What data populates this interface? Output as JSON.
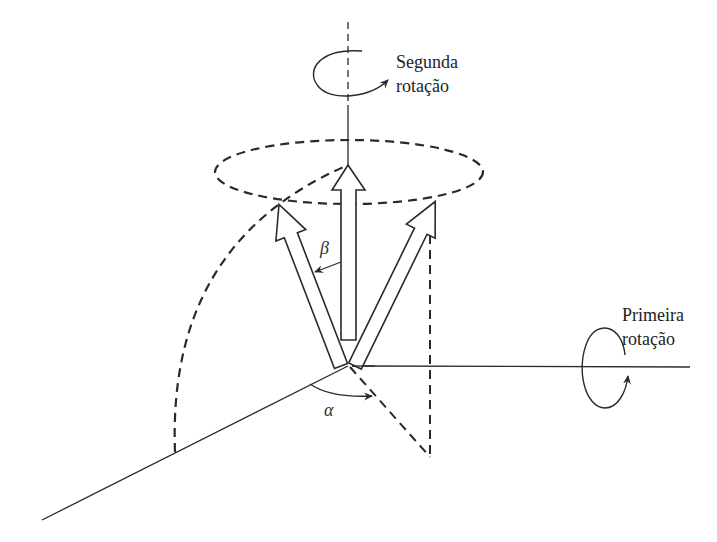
{
  "diagram": {
    "colors": {
      "stroke": "#2a2a2a",
      "background": "#ffffff"
    },
    "labels": {
      "second_rotation": {
        "line1": "Segunda",
        "line2": "rotação"
      },
      "first_rotation": {
        "line1": "Primeira",
        "line2": "rotação"
      },
      "beta": "β",
      "alpha": "α"
    },
    "elements": [
      "vertical-axis",
      "horizontal-axis",
      "oblique-axis",
      "dashed-ellipse",
      "dashed-arc",
      "center-arrow",
      "left-arrow",
      "right-arrow",
      "beta-angle-arrow",
      "alpha-angle-arc",
      "projection-lines",
      "second-rotation-icon",
      "first-rotation-icon"
    ]
  }
}
